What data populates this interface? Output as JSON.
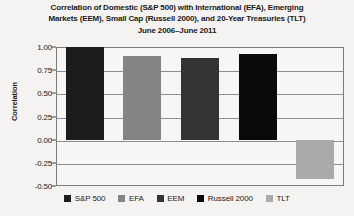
{
  "chart_data": {
    "type": "bar",
    "title": "Correlation of Domestic (S&P 500) with International (EFA), Emerging Markets (EEM), Small Cap (Russell 2000), and 20-Year Treasuries (TLT) June 2006–June 2011",
    "title_lines": [
      "Correlation of Domestic (S&P 500) with International (EFA), Emerging",
      "Markets (EEM), Small Cap (Russell 2000), and 20-Year Treasuries (TLT)",
      "June 2006–June 2011"
    ],
    "xlabel": "",
    "ylabel": "Correlation",
    "ylim": [
      -0.5,
      1.0
    ],
    "ytick_step": 0.25,
    "ytick_labels": [
      "1.00",
      "0.75",
      "0.50",
      "0.25",
      "0.00",
      "-0.25",
      "-0.50"
    ],
    "ytick_values": [
      1.0,
      0.75,
      0.5,
      0.25,
      0.0,
      -0.25,
      -0.5
    ],
    "grid": true,
    "legend_position": "bottom",
    "categories": [
      "S&P 500",
      "EFA",
      "EEM",
      "Russell 2000",
      "TLT"
    ],
    "values": [
      1.0,
      0.9,
      0.88,
      0.92,
      -0.42
    ],
    "colors": [
      "#1c1c1c",
      "#848484",
      "#343434",
      "#0a0a0a",
      "#aaaaaa"
    ],
    "series": [
      {
        "name": "Correlation",
        "points": [
          {
            "label": "S&P 500",
            "value": 1.0,
            "color": "#1c1c1c"
          },
          {
            "label": "EFA",
            "value": 0.9,
            "color": "#848484"
          },
          {
            "label": "EEM",
            "value": 0.88,
            "color": "#343434"
          },
          {
            "label": "Russell 2000",
            "value": 0.92,
            "color": "#0a0a0a"
          },
          {
            "label": "TLT",
            "value": -0.42,
            "color": "#aaaaaa"
          }
        ]
      }
    ]
  },
  "legend": {
    "items": [
      {
        "label": "S&P 500",
        "color": "#1c1c1c"
      },
      {
        "label": "EFA",
        "color": "#848484"
      },
      {
        "label": "EEM",
        "color": "#343434"
      },
      {
        "label": "Russell 2000",
        "color": "#0a0a0a"
      },
      {
        "label": "TLT",
        "color": "#aaaaaa"
      }
    ]
  },
  "theme": {
    "plot_background": "#f7f6f4",
    "page_background": "#f4f3f1",
    "axis_color": "#7b7b7b",
    "grid_color": "#8d8d8d",
    "text_color": "#1a1a1a"
  }
}
